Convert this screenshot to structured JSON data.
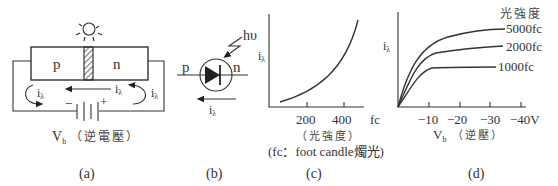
{
  "panel_a": {
    "caption": "(a)",
    "p_label": "p",
    "n_label": "n",
    "current_label": "i",
    "current_sub": "λ",
    "minus": "−",
    "plus": "+",
    "vb_label": "V",
    "vb_sub": "b",
    "vb_desc": "（逆電壓）",
    "icons": [
      "light-source-icon",
      "battery-icon",
      "depletion-region-hatch"
    ]
  },
  "panel_b": {
    "caption": "(b)",
    "p_label": "p",
    "n_label": "n",
    "photon_label": "hυ",
    "current_label": "i",
    "current_sub": "λ",
    "icons": [
      "photodiode-symbol-icon",
      "lightning-arrow-icon"
    ]
  },
  "panel_c": {
    "caption": "(c)",
    "ylabel": "i",
    "ylabel_sub": "λ",
    "ticks": [
      "200",
      "400"
    ],
    "xunit": "fc",
    "xlabel": "（光強度）",
    "note": "(fc：foot candle燭光)"
  },
  "panel_d": {
    "caption": "(d)",
    "ylabel": "i",
    "ylabel_sub": "λ",
    "legend_title": "光強度",
    "curves": [
      "5000fc",
      "2000fc",
      "1000fc"
    ],
    "ticks": [
      "−10",
      "−20",
      "−30",
      "−40V"
    ],
    "xlabel": "V",
    "xlabel_sub": "b",
    "xlabel_desc": "（逆壓）"
  }
}
